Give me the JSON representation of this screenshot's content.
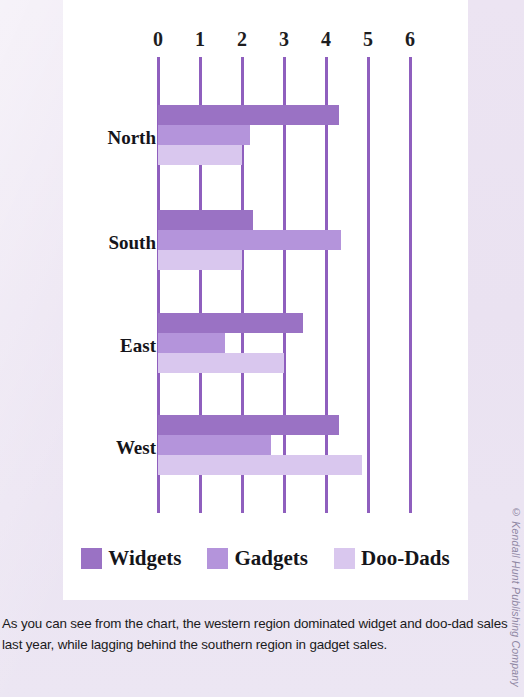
{
  "chart_data": {
    "type": "bar",
    "orientation": "horizontal",
    "title": "",
    "xlabel": "",
    "ylabel": "",
    "xlim": [
      0,
      6
    ],
    "xticks": [
      "0",
      "1",
      "2",
      "3",
      "4",
      "5",
      "6"
    ],
    "grid": true,
    "legend_position": "bottom",
    "categories": [
      "North",
      "South",
      "East",
      "West"
    ],
    "series": [
      {
        "name": "Widgets",
        "color": "#9a72c4",
        "values": [
          4.3,
          2.25,
          3.45,
          4.3
        ]
      },
      {
        "name": "Gadgets",
        "color": "#b494db",
        "values": [
          2.2,
          4.35,
          1.6,
          2.7
        ]
      },
      {
        "name": "Doo-Dads",
        "color": "#d9c7ee",
        "values": [
          2.0,
          2.0,
          3.0,
          4.85
        ]
      }
    ]
  },
  "legend": {
    "entries": [
      {
        "label": "Widgets"
      },
      {
        "label": "Gadgets"
      },
      {
        "label": "Doo-Dads"
      }
    ]
  },
  "caption": {
    "line1": "As you can see from the chart, the western region dominated widget and doo-dad sales",
    "line2": "last year, while lagging behind the southern region in gadget sales."
  },
  "credit": {
    "text": "© Kendall Hunt Publishing Company"
  },
  "colors": {
    "widgets": "#9a72c4",
    "gadgets": "#b494db",
    "doodads": "#d9c7ee",
    "gridline": "#8f5fbe",
    "panel": "#ffffff",
    "page": "#ece4f2"
  }
}
